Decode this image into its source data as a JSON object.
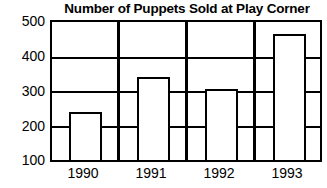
{
  "chart_data": {
    "type": "bar",
    "title": "Number of Puppets Sold at Play Corner",
    "xlabel": "",
    "ylabel": "",
    "categories": [
      "1990",
      "1991",
      "1992",
      "1993"
    ],
    "values": [
      240,
      340,
      305,
      465
    ],
    "series": [
      {
        "name": "Puppets Sold",
        "values": [
          240,
          340,
          305,
          465
        ]
      }
    ],
    "ylim": [
      100,
      500
    ],
    "yticks": [
      100,
      200,
      300,
      400,
      500
    ],
    "ytick_labels": [
      "100",
      "200",
      "300",
      "400",
      "500"
    ],
    "xtick_labels": [
      "1990",
      "1991",
      "1992",
      "1993"
    ],
    "grid": true,
    "grid_axis": "y",
    "legend": false,
    "legend_position": "none",
    "bar_fill_color": "#ffffff",
    "bar_edge_color": "#000000",
    "axis_color": "#000000",
    "background_color": "#ffffff",
    "group_separators": true,
    "annotations": []
  },
  "labels": {
    "title": "Number of Puppets Sold at Play Corner",
    "y_500": "500",
    "y_400": "400",
    "y_300": "300",
    "y_200": "200",
    "y_100": "100",
    "x_1990": "1990",
    "x_1991": "1991",
    "x_1992": "1992",
    "x_1993": "1993"
  }
}
